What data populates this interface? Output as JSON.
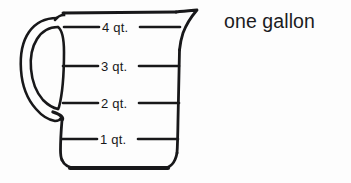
{
  "figure": {
    "title_text": "one gallon",
    "ink_color": "#18181a",
    "background_color": "#fdfdfd"
  },
  "caption": {
    "text": "one gallon"
  },
  "pitcher": {
    "name": "measuring-cup",
    "parts": {
      "handle": "oval-loop-handle",
      "spout": "pouring-spout",
      "body": "tapered-body",
      "base": "rounded-base"
    }
  },
  "graduations": [
    {
      "label": "4 qt.",
      "value": 4,
      "unit": "qt.",
      "y": 27
    },
    {
      "label": "3 qt.",
      "value": 3,
      "unit": "qt.",
      "y": 66
    },
    {
      "label": "2 qt.",
      "value": 2,
      "unit": "qt.",
      "y": 103
    },
    {
      "label": "1 qt.",
      "value": 1,
      "unit": "qt.",
      "y": 139
    }
  ]
}
